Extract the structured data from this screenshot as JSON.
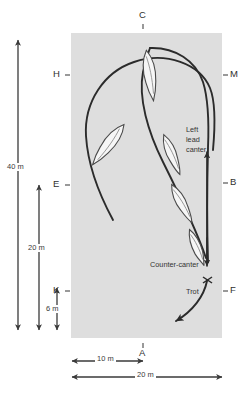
{
  "diagram": {
    "arena": {
      "fill_color": "#dedede",
      "x": 71,
      "y": 33,
      "width": 151,
      "height": 305
    },
    "line_color": "#2b2b2b",
    "horse_fill": "#f4f4f4",
    "markers": [
      {
        "id": "C",
        "label": "C",
        "position": "top-center"
      },
      {
        "id": "H",
        "label": "H",
        "position": "left-upper"
      },
      {
        "id": "E",
        "label": "E",
        "position": "left-middle"
      },
      {
        "id": "K",
        "label": "K",
        "position": "left-lower"
      },
      {
        "id": "A",
        "label": "A",
        "position": "bottom-center"
      },
      {
        "id": "M",
        "label": "M",
        "position": "right-upper"
      },
      {
        "id": "B",
        "label": "B",
        "position": "right-middle"
      },
      {
        "id": "F",
        "label": "F",
        "position": "right-lower"
      }
    ],
    "gait_annotations": [
      {
        "id": "left-lead-canter",
        "lines": [
          "Left",
          "lead",
          "canter"
        ]
      },
      {
        "id": "counter-canter",
        "lines": [
          "Counter-canter"
        ]
      },
      {
        "id": "trot",
        "lines": [
          "Trot"
        ]
      }
    ],
    "dimensions": {
      "vertical": [
        {
          "id": "forty-metre",
          "label": "40 m"
        },
        {
          "id": "twenty-metre",
          "label": "20 m"
        },
        {
          "id": "six-metre",
          "label": "6 m"
        }
      ],
      "horizontal": [
        {
          "id": "ten-metre",
          "label": "10 m"
        },
        {
          "id": "twenty-metre-width",
          "label": "20 m"
        }
      ]
    }
  }
}
